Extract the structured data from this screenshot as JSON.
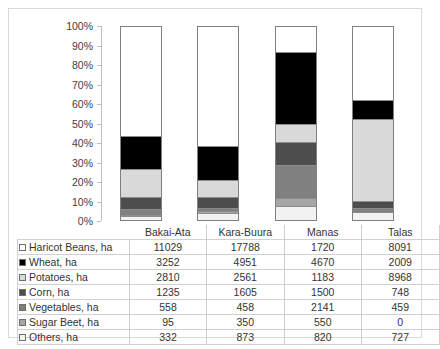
{
  "chart_data": {
    "type": "bar",
    "subtype": "stacked-100-percent",
    "title": "",
    "xlabel": "",
    "ylabel": "",
    "ylim": [
      0,
      100
    ],
    "ytick_labels": [
      "100%",
      "90%",
      "80%",
      "70%",
      "60%",
      "50%",
      "40%",
      "30%",
      "20%",
      "10%",
      "0%"
    ],
    "ytick_values": [
      100,
      90,
      80,
      70,
      60,
      50,
      40,
      30,
      20,
      10,
      0
    ],
    "grid": false,
    "legend_position": "data-table",
    "categories": [
      "Bakai-Ata",
      "Kara-Buura",
      "Manas",
      "Talas"
    ],
    "series": [
      {
        "name": "Haricot Beans, ha",
        "color": "#ffffff",
        "values": [
          11029,
          17788,
          1720,
          8091
        ],
        "percent": [
          57.0,
          61.8,
          13.2,
          38.0
        ]
      },
      {
        "name": "Wheat, ha",
        "color": "#000000",
        "values": [
          3252,
          4951,
          4670,
          2009
        ],
        "percent": [
          16.8,
          17.2,
          35.8,
          9.4
        ]
      },
      {
        "name": "Potatoes, ha",
        "color": "#d9d9d9",
        "values": [
          2810,
          2561,
          1183,
          8968
        ],
        "percent": [
          14.5,
          8.9,
          9.1,
          42.1
        ]
      },
      {
        "name": "Corn, ha",
        "color": "#4d4d4d",
        "values": [
          1235,
          1605,
          1500,
          748
        ],
        "percent": [
          6.4,
          5.6,
          11.5,
          3.5
        ]
      },
      {
        "name": "Vegetables, ha",
        "color": "#808080",
        "values": [
          558,
          458,
          2141,
          459
        ],
        "percent": [
          2.9,
          1.6,
          16.4,
          2.2
        ]
      },
      {
        "name": "Sugar Beet, ha",
        "color": "#a6a6a6",
        "values": [
          95,
          350,
          550,
          0
        ],
        "percent": [
          0.5,
          1.2,
          4.2,
          0.0
        ]
      },
      {
        "name": "Others, ha",
        "color": "#f2f2f2",
        "values": [
          332,
          873,
          820,
          727
        ],
        "percent": [
          1.7,
          3.0,
          6.3,
          3.4
        ]
      }
    ]
  },
  "table": {
    "corner_label": "",
    "column_headers": [
      "Bakai-Ata",
      "Kara-Buura",
      "Manas",
      "Talas"
    ],
    "rows": [
      {
        "label": "Haricot Beans, ha",
        "swatch": "#ffffff",
        "cells": [
          "11029",
          "17788",
          "1720",
          "8091"
        ]
      },
      {
        "label": "Wheat, ha",
        "swatch": "#000000",
        "cells": [
          "3252",
          "4951",
          "4670",
          "2009"
        ]
      },
      {
        "label": "Potatoes, ha",
        "swatch": "#d9d9d9",
        "cells": [
          "2810",
          "2561",
          "1183",
          "8968"
        ]
      },
      {
        "label": "Corn, ha",
        "swatch": "#4d4d4d",
        "cells": [
          "1235",
          "1605",
          "1500",
          "748"
        ]
      },
      {
        "label": "Vegetables, ha",
        "swatch": "#808080",
        "cells": [
          "558",
          "458",
          "2141",
          "459"
        ]
      },
      {
        "label": "Sugar Beet, ha",
        "swatch": "#a6a6a6",
        "cells": [
          "95",
          "350",
          "550",
          "0"
        ]
      },
      {
        "label": "Others, ha",
        "swatch": "#f2f2f2",
        "cells": [
          "332",
          "873",
          "820",
          "727"
        ]
      }
    ]
  }
}
